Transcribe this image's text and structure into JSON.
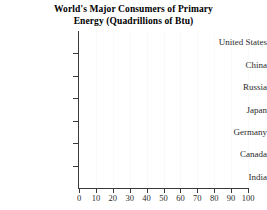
{
  "chart_data": {
    "type": "bar",
    "orientation": "horizontal",
    "title": "World's Major Consumers of Primary Energy (Quadrillions of Btu)",
    "title_lines": [
      "World's Major Consumers of Primary",
      "Energy (Quadrillions of Btu)"
    ],
    "xlabel": "",
    "ylabel": "",
    "categories": [
      "United States",
      "China",
      "Russia",
      "Japan",
      "Germany",
      "Canada",
      "India"
    ],
    "values": [
      null,
      null,
      null,
      null,
      null,
      null,
      null
    ],
    "series_rendered": false,
    "xlim": [
      0,
      100
    ],
    "xticks": [
      0,
      10,
      20,
      30,
      40,
      50,
      60,
      70,
      80,
      90,
      100
    ],
    "xtick_labels": [
      "0",
      "10",
      "20",
      "30",
      "40",
      "50",
      "60",
      "70",
      "80",
      "90",
      "100"
    ],
    "grid": "vertical-faint",
    "legend": null,
    "colors": {
      "background": "#ffffff",
      "axis": "#3a3a3a",
      "gridline": "#fafafa",
      "text": "#2b2b2b",
      "title": "#000000"
    }
  }
}
